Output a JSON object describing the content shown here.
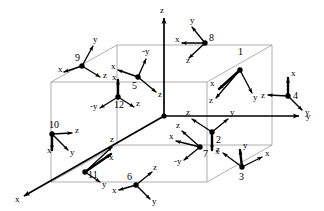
{
  "figure": {
    "title": "",
    "global_axes": [
      {
        "name": "z-axis",
        "label": "z",
        "direction": "up",
        "origin": [
          164,
          116
        ],
        "tip": [
          164,
          18
        ],
        "label_pos": [
          160,
          13
        ]
      },
      {
        "name": "y-axis",
        "label": "y",
        "direction": "right",
        "origin": [
          164,
          116
        ],
        "tip": [
          299,
          116
        ],
        "label_pos": [
          306,
          119
        ]
      },
      {
        "name": "x-axis",
        "label": "x",
        "direction": "down-left",
        "origin": [
          164,
          116
        ],
        "tip": [
          24,
          196
        ],
        "label_pos": [
          15,
          202
        ]
      }
    ],
    "box": {
      "name": "wireframe-box",
      "top_back_left": [
        117,
        45
      ],
      "top_back_right": [
        272,
        45
      ],
      "top_front_left": [
        51,
        82
      ],
      "top_front_right": [
        207,
        82
      ],
      "bottom_back_left": [
        117,
        145
      ],
      "bottom_back_right": [
        272,
        145
      ],
      "bottom_front_left": [
        51,
        182
      ],
      "bottom_front_right": [
        207,
        182
      ]
    },
    "frames": [
      {
        "id": "1",
        "label": "1",
        "name": "frame-1",
        "origin": [
          240,
          70
        ],
        "label_pos": [
          238,
          55
        ],
        "axes": [
          {
            "axis": "x",
            "tip": [
              219,
              89
            ],
            "label": "x",
            "label_pos": [
              210,
              86
            ],
            "thick": true
          },
          {
            "axis": "z",
            "tip": [
              216,
              98
            ],
            "label": "z",
            "label_pos": [
              209,
              103
            ],
            "thick": false
          },
          {
            "axis": "y",
            "tip": [
              252,
              93
            ],
            "label": "y",
            "label_pos": [
              253,
              100
            ],
            "thick": false
          }
        ]
      },
      {
        "id": "2",
        "label": "2",
        "name": "frame-2",
        "origin": [
          212,
          132
        ],
        "label_pos": [
          216,
          143
        ],
        "axes": [
          {
            "axis": "z",
            "tip": [
              192,
              119
            ],
            "label": "z",
            "label_pos": [
              186,
              115
            ],
            "thick": false
          },
          {
            "axis": "y",
            "tip": [
              228,
              119
            ],
            "label": "y",
            "label_pos": [
              230,
              115
            ],
            "thick": false
          },
          {
            "axis": "x",
            "tip": [
              212,
              150
            ],
            "label": "x",
            "label_pos": [
              215,
              154
            ],
            "thick": true
          }
        ]
      },
      {
        "id": "3",
        "label": "3",
        "name": "frame-3",
        "origin": [
          242,
          167
        ],
        "label_pos": [
          239,
          180
        ],
        "axes": [
          {
            "axis": "y",
            "tip": [
              240,
              150
            ],
            "label": "y",
            "label_pos": [
              243,
              148
            ],
            "thick": true
          },
          {
            "axis": "z",
            "tip": [
              223,
              153
            ],
            "label": "z",
            "label_pos": [
              216,
              152
            ],
            "thick": false
          },
          {
            "axis": "x",
            "tip": [
              262,
              157
            ],
            "label": "x",
            "label_pos": [
              265,
              156
            ],
            "thick": false
          }
        ]
      },
      {
        "id": "4",
        "label": "4",
        "name": "frame-4",
        "origin": [
          288,
          96
        ],
        "label_pos": [
          293,
          99
        ],
        "axes": [
          {
            "axis": "x",
            "tip": [
              288,
              78
            ],
            "label": "x",
            "label_pos": [
              291,
              76
            ],
            "thick": true
          },
          {
            "axis": "z",
            "tip": [
              268,
              95
            ],
            "label": "z",
            "label_pos": [
              261,
              98
            ],
            "thick": false
          },
          {
            "axis": "y",
            "tip": [
              302,
              110
            ],
            "label": "y",
            "label_pos": [
              305,
              115
            ],
            "thick": false
          }
        ]
      },
      {
        "id": "5",
        "label": "5",
        "name": "frame-5",
        "origin": [
          138,
          77
        ],
        "label_pos": [
          132,
          89
        ],
        "axes": [
          {
            "axis": "-y",
            "tip": [
              146,
              59
            ],
            "label": "-y",
            "label_pos": [
              142,
              54
            ],
            "thick": false
          },
          {
            "axis": "x",
            "tip": [
              118,
              70
            ],
            "label": "x",
            "label_pos": [
              111,
              69
            ],
            "thick": false
          },
          {
            "axis": "z",
            "tip": [
              156,
              92
            ],
            "label": "z",
            "label_pos": [
              158,
              97
            ],
            "thick": false
          }
        ]
      },
      {
        "id": "6",
        "label": "6",
        "name": "frame-6",
        "origin": [
          136,
          185
        ],
        "label_pos": [
          127,
          180
        ],
        "axes": [
          {
            "axis": "z",
            "tip": [
              152,
              172
            ],
            "label": "z",
            "label_pos": [
              153,
              170
            ],
            "thick": false
          },
          {
            "axis": "x",
            "tip": [
              119,
              190
            ],
            "label": "x",
            "label_pos": [
              112,
              193
            ],
            "thick": false
          },
          {
            "axis": "y",
            "tip": [
              150,
              199
            ],
            "label": "y",
            "label_pos": [
              152,
              204
            ],
            "thick": false
          }
        ]
      },
      {
        "id": "7",
        "label": "7",
        "name": "frame-7",
        "origin": [
          200,
          147
        ],
        "label_pos": [
          203,
          157
        ],
        "axes": [
          {
            "axis": "z",
            "tip": [
              182,
              131
            ],
            "label": "z",
            "label_pos": [
              176,
              128
            ],
            "thick": false
          },
          {
            "axis": "x",
            "tip": [
              176,
              141
            ],
            "label": "x",
            "label_pos": [
              169,
              139
            ],
            "thick": false
          },
          {
            "axis": "-y",
            "tip": [
              184,
              160
            ],
            "label": "-y",
            "label_pos": [
              174,
              164
            ],
            "thick": false
          }
        ]
      },
      {
        "id": "8",
        "label": "8",
        "name": "frame-8",
        "origin": [
          205,
          43
        ],
        "label_pos": [
          209,
          41
        ],
        "axes": [
          {
            "axis": "y",
            "tip": [
              192,
              27
            ],
            "label": "y",
            "label_pos": [
              190,
              23
            ],
            "thick": false
          },
          {
            "axis": "x",
            "tip": [
              182,
              43
            ],
            "label": "x",
            "label_pos": [
              175,
              42
            ],
            "thick": false
          },
          {
            "axis": "z",
            "tip": [
              189,
              58
            ],
            "label": "z",
            "label_pos": [
              186,
              63
            ],
            "thick": false
          }
        ]
      },
      {
        "id": "9",
        "label": "9",
        "name": "frame-9",
        "origin": [
          82,
          66
        ],
        "label_pos": [
          75,
          61
        ],
        "axes": [
          {
            "axis": "y",
            "tip": [
              93,
              46
            ],
            "label": "y",
            "label_pos": [
              93,
              42
            ],
            "thick": false
          },
          {
            "axis": "x",
            "tip": [
              64,
              72
            ],
            "label": "x",
            "label_pos": [
              58,
              72
            ],
            "thick": false
          },
          {
            "axis": "z",
            "tip": [
              100,
              77
            ],
            "label": "z",
            "label_pos": [
              103,
              78
            ],
            "thick": false
          }
        ]
      },
      {
        "id": "10",
        "label": "10",
        "name": "frame-10",
        "origin": [
          52,
          134
        ],
        "label_pos": [
          49,
          128
        ],
        "axes": [
          {
            "axis": "z",
            "tip": [
              72,
              133
            ],
            "label": "z",
            "label_pos": [
              75,
              133
            ],
            "thick": false
          },
          {
            "axis": "x",
            "tip": [
              52,
              150
            ],
            "label": "x",
            "label_pos": [
              47,
              153
            ],
            "thick": true
          },
          {
            "axis": "y",
            "tip": [
              68,
              150
            ],
            "label": "y",
            "label_pos": [
              70,
              155
            ],
            "thick": false
          }
        ]
      },
      {
        "id": "11",
        "label": "11",
        "name": "frame-11",
        "origin": [
          85,
          172
        ],
        "label_pos": [
          88,
          178
        ],
        "axes": [
          {
            "axis": "z",
            "tip": [
              112,
              147
            ],
            "label": "z",
            "label_pos": [
              110,
              142
            ],
            "thick": false
          },
          {
            "axis": "x",
            "tip": [
              111,
              154
            ],
            "label": "x",
            "label_pos": [
              109,
              160
            ],
            "thick": true
          },
          {
            "axis": "y",
            "tip": [
              100,
              182
            ],
            "label": "y",
            "label_pos": [
              102,
              187
            ],
            "thick": false
          }
        ]
      },
      {
        "id": "12",
        "label": "12",
        "name": "frame-12",
        "origin": [
          118,
          97
        ],
        "label_pos": [
          114,
          108
        ],
        "axes": [
          {
            "axis": "x",
            "tip": [
              118,
              80
            ],
            "label": "x",
            "label_pos": [
              112,
              80
            ],
            "thick": true
          },
          {
            "axis": "-y",
            "tip": [
              100,
              108
            ],
            "label": "-y",
            "label_pos": [
              90,
              109
            ],
            "thick": false
          },
          {
            "axis": "z",
            "tip": [
              134,
              107
            ],
            "label": "z",
            "label_pos": [
              136,
              106
            ],
            "thick": false
          }
        ]
      }
    ],
    "colors": {
      "background": "#ffffff",
      "box_edge": "#9a9a9a",
      "axis": "#000000",
      "text": "#000000"
    }
  }
}
